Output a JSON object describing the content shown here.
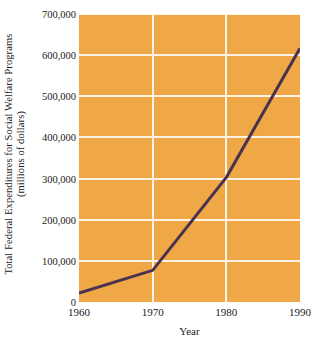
{
  "chart_data": {
    "type": "line",
    "title": "",
    "xlabel": "Year",
    "ylabel": "Total Federal Expenditures for Social Welfare Programs",
    "ylabel_line2": "(millions of dollars)",
    "x": [
      1960,
      1970,
      1980,
      1990
    ],
    "values": [
      22000,
      77000,
      303000,
      617000
    ],
    "xlim": [
      1960,
      1990
    ],
    "ylim": [
      0,
      700000
    ],
    "xticks": [
      1960,
      1970,
      1980,
      1990
    ],
    "xtick_labels": [
      "1960",
      "1970",
      "1980",
      "1990"
    ],
    "yticks": [
      0,
      100000,
      200000,
      300000,
      400000,
      500000,
      600000,
      700000
    ],
    "ytick_labels": [
      "0",
      "100,000",
      "200,000",
      "300,000",
      "400,000",
      "500,000",
      "600,000",
      "700,000"
    ],
    "grid": true,
    "grid_color": "#fdf4e3",
    "plot_background": "#efa845",
    "line_color": "#4b3150",
    "line_width": 3,
    "legend": null,
    "legend_position": "none",
    "annotations": []
  }
}
